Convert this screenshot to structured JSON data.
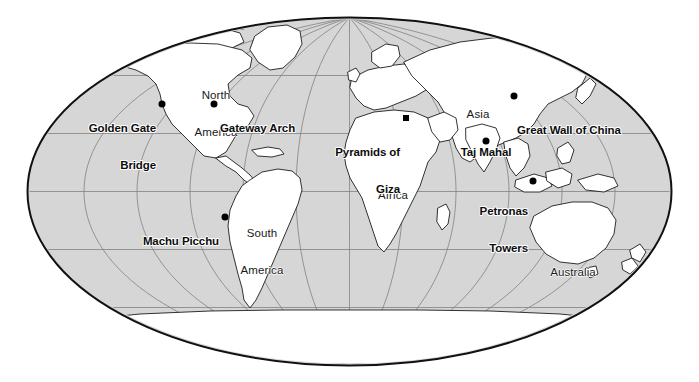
{
  "figure": {
    "name": "world-map-landmarks",
    "projection": "elliptical-world-projection",
    "ocean_color": "#d6d6d6",
    "land_color": "#ffffff",
    "graticule_color": "#7a7a7a",
    "coastline_color": "#111111",
    "outline_color": "#111111",
    "background_color": "#ffffff",
    "marker_color": "#000000"
  },
  "map": {
    "ellipse": {
      "cx": 349.5,
      "cy": 191.5,
      "rx": 322,
      "ry": 174
    },
    "graticule": {
      "parallel_spacing_deg": 30,
      "meridian_spacing_deg": 30,
      "parallels": [
        -60,
        -30,
        0,
        30,
        60
      ],
      "meridians": [
        -180,
        -150,
        -120,
        -90,
        -60,
        -30,
        0,
        30,
        60,
        90,
        120,
        150,
        180
      ]
    }
  },
  "landmarks": [
    {
      "id": "golden-gate-bridge",
      "label": "Golden Gate\nBridge",
      "label_line1": "Golden Gate",
      "label_line2": "Bridge",
      "dot": {
        "x": 162,
        "y": 104
      },
      "label_anchor": {
        "x": 156,
        "y": 98
      },
      "align": "right"
    },
    {
      "id": "gateway-arch",
      "label": "Gateway Arch",
      "label_line1": "Gateway Arch",
      "label_line2": "",
      "dot": {
        "x": 214,
        "y": 104
      },
      "label_anchor": {
        "x": 220,
        "y": 98
      },
      "align": "left"
    },
    {
      "id": "pyramids-of-giza",
      "label": "Pyramids of\nGiza",
      "label_line1": "Pyramids of",
      "label_line2": "Giza",
      "dot": {
        "x": 406,
        "y": 118
      },
      "label_anchor": {
        "x": 400,
        "y": 122
      },
      "align": "right",
      "marker_shape": "square"
    },
    {
      "id": "taj-mahal",
      "label": "Taj Mahal",
      "label_line1": "Taj Mahal",
      "label_line2": "",
      "dot": {
        "x": 486,
        "y": 141
      },
      "label_anchor": {
        "x": 486,
        "y": 122
      },
      "align": "center"
    },
    {
      "id": "great-wall-of-china",
      "label": "Great Wall of China",
      "label_line1": "Great Wall of China",
      "label_line2": "",
      "dot": {
        "x": 514,
        "y": 96
      },
      "label_anchor": {
        "x": 517,
        "y": 100
      },
      "align": "left"
    },
    {
      "id": "petronas-towers",
      "label": "Petronas\nTowers",
      "label_line1": "Petronas",
      "label_line2": "Towers",
      "dot": {
        "x": 533,
        "y": 181
      },
      "label_anchor": {
        "x": 528,
        "y": 181
      },
      "align": "right"
    },
    {
      "id": "machu-picchu",
      "label": "Machu Picchu",
      "label_line1": "Machu Picchu",
      "label_line2": "",
      "dot": {
        "x": 225,
        "y": 217
      },
      "label_anchor": {
        "x": 219,
        "y": 211
      },
      "align": "right"
    }
  ],
  "continents": [
    {
      "id": "north-america",
      "label": "North\nAmerica",
      "label_line1": "North",
      "label_line2": "America",
      "anchor": {
        "x": 216,
        "y": 65
      },
      "align": "center"
    },
    {
      "id": "south-america",
      "label": "South\nAmerica",
      "label_line1": "South",
      "label_line2": "America",
      "anchor": {
        "x": 262,
        "y": 203
      },
      "align": "center"
    },
    {
      "id": "africa",
      "label": "Africa",
      "label_line1": "Africa",
      "label_line2": "",
      "anchor": {
        "x": 393,
        "y": 165
      },
      "align": "center"
    },
    {
      "id": "asia",
      "label": "Asia",
      "label_line1": "Asia",
      "label_line2": "",
      "anchor": {
        "x": 478,
        "y": 84
      },
      "align": "center"
    },
    {
      "id": "australia",
      "label": "Australia",
      "label_line1": "Australia",
      "label_line2": "",
      "anchor": {
        "x": 573,
        "y": 242
      },
      "align": "center"
    }
  ]
}
